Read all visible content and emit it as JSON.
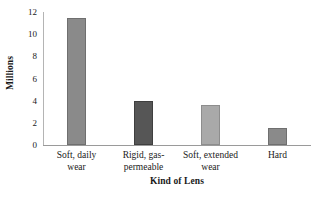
{
  "chart_data": {
    "type": "bar",
    "title": "",
    "xlabel": "Kind of Lens",
    "ylabel": "Millions",
    "categories": [
      "Soft, daily wear",
      "Rigid, gas-permeable",
      "Soft, extended wear",
      "Hard"
    ],
    "category_lines": [
      [
        "Soft, daily",
        "wear"
      ],
      [
        "Rigid, gas-",
        "permeable"
      ],
      [
        "Soft, extended",
        "wear"
      ],
      [
        "Hard"
      ]
    ],
    "values": [
      11.5,
      4.0,
      3.6,
      1.5
    ],
    "ylim": [
      0,
      12
    ],
    "yticks": [
      0,
      2,
      4,
      6,
      8,
      10,
      12
    ],
    "ytick_labels": [
      "0",
      "2",
      "4",
      "6",
      "8",
      "10",
      "12"
    ],
    "grid": false,
    "legend": false,
    "bar_colors": [
      "#8a8a8a",
      "#565656",
      "#a9a9a9",
      "#8a8a8a"
    ],
    "bar_edge_colors": [
      "#6f6f6f",
      "#3f3f3f",
      "#8d8d8d",
      "#6f6f6f"
    ],
    "axis_color": "#9a9a9a",
    "background_color": "#ffffff",
    "text_color": "#1a1a1a"
  }
}
